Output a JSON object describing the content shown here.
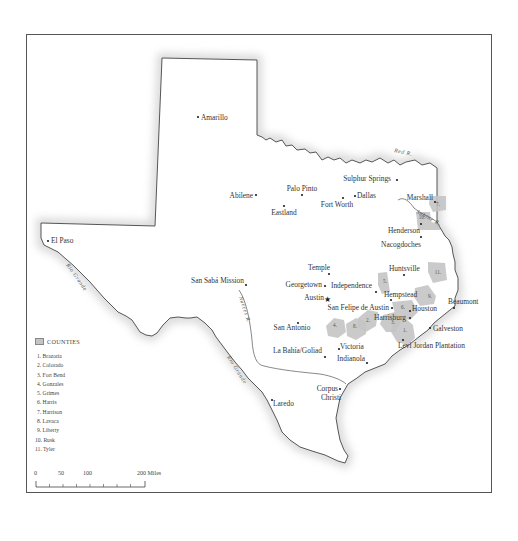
{
  "map": {
    "cities": [
      {
        "name": "Amarillo",
        "x": 198,
        "y": 117,
        "label_dx": 3,
        "label_dy": 3,
        "anchor": "start"
      },
      {
        "name": "Abilene",
        "x": 256,
        "y": 195,
        "label_dx": -3,
        "label_dy": 3,
        "anchor": "end"
      },
      {
        "name": "Palo Pinto",
        "x": 302,
        "y": 195,
        "label_dx": 0,
        "label_dy": -4,
        "anchor": "middle"
      },
      {
        "name": "Eastland",
        "x": 284,
        "y": 206,
        "label_dx": 0,
        "label_dy": 9,
        "anchor": "middle"
      },
      {
        "name": "Fort Worth",
        "x": 343,
        "y": 198,
        "label_dx": -6,
        "label_dy": 9,
        "anchor": "middle"
      },
      {
        "name": "Dallas",
        "x": 355,
        "y": 196,
        "label_dx": 2,
        "label_dy": 2,
        "anchor": "start"
      },
      {
        "name": "Sulphur Springs",
        "x": 397,
        "y": 180,
        "label_dx": -6,
        "label_dy": 1,
        "anchor": "end"
      },
      {
        "name": "Marshall",
        "x": 435,
        "y": 202,
        "label_dx": -2,
        "label_dy": -2,
        "anchor": "end"
      },
      {
        "name": "Henderson",
        "x": 421,
        "y": 224,
        "label_dx": -1,
        "label_dy": 9,
        "anchor": "end"
      },
      {
        "name": "Nacogdoches",
        "x": 421,
        "y": 237,
        "label_dx": -20,
        "label_dy": 10,
        "anchor": "middle"
      },
      {
        "name": "El Paso",
        "x": 48,
        "y": 241,
        "label_dx": 3,
        "label_dy": 2,
        "anchor": "start"
      },
      {
        "name": "San Sabá Mission",
        "x": 246,
        "y": 285,
        "label_dx": -2,
        "label_dy": -2,
        "anchor": "end"
      },
      {
        "name": "Temple",
        "x": 329,
        "y": 274,
        "label_dx": -10,
        "label_dy": -4,
        "anchor": "middle"
      },
      {
        "name": "Georgetown",
        "x": 325,
        "y": 286,
        "label_dx": -3,
        "label_dy": 1,
        "anchor": "end"
      },
      {
        "name": "Independence",
        "x": 376,
        "y": 292,
        "label_dx": -4,
        "label_dy": -4,
        "anchor": "end"
      },
      {
        "name": "Austin",
        "x": 327,
        "y": 299,
        "label_dx": -3,
        "label_dy": 1,
        "anchor": "end",
        "capital": true
      },
      {
        "name": "Huntsville",
        "x": 404,
        "y": 275,
        "label_dx": -15,
        "label_dy": -4,
        "anchor": "start"
      },
      {
        "name": "Hempstead",
        "x": 391,
        "y": 300,
        "label_dx": -7,
        "label_dy": -3,
        "anchor": "start"
      },
      {
        "name": "San Felipe de Austin",
        "x": 392,
        "y": 308,
        "label_dx": -3,
        "label_dy": 2,
        "anchor": "end"
      },
      {
        "name": "Houston",
        "x": 410,
        "y": 311,
        "label_dx": 2,
        "label_dy": 0,
        "anchor": "start"
      },
      {
        "name": "Harrisburg",
        "x": 410,
        "y": 318,
        "label_dx": -4,
        "label_dy": 2,
        "anchor": "end"
      },
      {
        "name": "Beaumont",
        "x": 454,
        "y": 308,
        "label_dx": -6,
        "label_dy": -4,
        "anchor": "start"
      },
      {
        "name": "Galveston",
        "x": 430,
        "y": 328,
        "label_dx": 3,
        "label_dy": 3,
        "anchor": "start"
      },
      {
        "name": "San Antonio",
        "x": 298,
        "y": 323,
        "label_dx": -6,
        "label_dy": 7,
        "anchor": "middle"
      },
      {
        "name": "Levi Jordan Plantation",
        "x": 403,
        "y": 340,
        "label_dx": -5,
        "label_dy": 8,
        "anchor": "start"
      },
      {
        "name": "Victoria",
        "x": 339,
        "y": 349,
        "label_dx": 1,
        "label_dy": 0,
        "anchor": "start"
      },
      {
        "name": "La Bahía/Goliad",
        "x": 325,
        "y": 357,
        "label_dx": -3,
        "label_dy": -4,
        "anchor": "end"
      },
      {
        "name": "Indianola",
        "x": 367,
        "y": 363,
        "label_dx": -2,
        "label_dy": -2,
        "anchor": "end"
      },
      {
        "name": "Corpus",
        "x": 340,
        "y": 389,
        "label_dx": -2,
        "label_dy": 2,
        "anchor": "end"
      },
      {
        "name": "Christi",
        "x": 340,
        "y": 389,
        "label_dx": -9,
        "label_dy": 11,
        "anchor": "middle"
      },
      {
        "name": "Laredo",
        "x": 272,
        "y": 400,
        "label_dx": 1,
        "label_dy": 6,
        "anchor": "start"
      }
    ],
    "rivers": [
      {
        "name": "Red R.",
        "x": 394,
        "y": 152,
        "rotate": 12
      },
      {
        "name": "Sabine R.",
        "x": 416,
        "y": 213,
        "rotate": 28
      },
      {
        "name": "Nueces R.",
        "x": 239,
        "y": 297,
        "rotate": 72
      },
      {
        "name": "Rio Grande",
        "x": 66,
        "y": 265,
        "rotate": 55
      },
      {
        "name": "Rio Grande",
        "x": 227,
        "y": 357,
        "rotate": 58
      }
    ],
    "counties": [
      {
        "num": "1.",
        "x": 405,
        "y": 332
      },
      {
        "num": "2.",
        "x": 368,
        "y": 322
      },
      {
        "num": "3.",
        "x": 393,
        "y": 324
      },
      {
        "num": "4.",
        "x": 335,
        "y": 327
      },
      {
        "num": "8.",
        "x": 355,
        "y": 328
      },
      {
        "num": "5.",
        "x": 385,
        "y": 283
      },
      {
        "num": "6.",
        "x": 403,
        "y": 309
      },
      {
        "num": "7.",
        "x": 438,
        "y": 206
      },
      {
        "num": "9.",
        "x": 430,
        "y": 298
      },
      {
        "num": "10.",
        "x": 422,
        "y": 219
      },
      {
        "num": "11.",
        "x": 438,
        "y": 274
      }
    ]
  },
  "legend": {
    "title": "COUNTIES",
    "items": [
      "1. Brazoria",
      "2. Colorado",
      "3. Fort Bend",
      "4. Gonzales",
      "5. Grimes",
      "6. Harris",
      "7. Harrison",
      "8. Lavaca",
      "9. Liberty",
      "10. Rusk",
      "11. Tyler"
    ]
  },
  "scale": {
    "labels": [
      {
        "text": "0",
        "x": 0
      },
      {
        "text": "50",
        "x": 26
      },
      {
        "text": "100",
        "x": 52
      },
      {
        "text": "200 Miles",
        "x": 105
      }
    ],
    "unit": "Miles"
  },
  "colors": {
    "county_fill": "#c4c4c4",
    "outline": "#444444",
    "frame": "#555555"
  }
}
